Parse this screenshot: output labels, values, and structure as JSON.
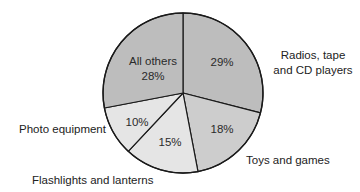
{
  "chart_data": {
    "type": "pie",
    "title": "",
    "start_angle_deg_from_top": 0,
    "direction": "clockwise",
    "center": [
      183,
      93
    ],
    "radius": 80,
    "slices": [
      {
        "name": "Radios, tape and CD players",
        "label_lines": [
          "Radios, tape",
          "and CD players"
        ],
        "value": 29,
        "pct_label": "29%",
        "color": "#bdbdbd",
        "pct_pos": [
          222,
          66
        ],
        "label_pos": [
          313,
          59
        ],
        "label_anchor": "middle"
      },
      {
        "name": "Toys and games",
        "label_lines": [
          "Toys and games"
        ],
        "value": 18,
        "pct_label": "18%",
        "color": "#cdcdcd",
        "pct_pos": [
          222,
          133
        ],
        "label_pos": [
          246,
          164
        ],
        "label_anchor": "start"
      },
      {
        "name": "Flashlights and lanterns",
        "label_lines": [
          "Flashlights and lanterns"
        ],
        "value": 15,
        "pct_label": "15%",
        "color": "#e5e5e5",
        "pct_pos": [
          170,
          146
        ],
        "label_pos": [
          32,
          184
        ],
        "label_anchor": "start"
      },
      {
        "name": "Photo equipment",
        "label_lines": [
          "Photo equipment"
        ],
        "value": 10,
        "pct_label": "10%",
        "color": "#e5e5e5",
        "pct_pos": [
          137,
          126
        ],
        "label_pos": [
          19,
          133
        ],
        "label_anchor": "start"
      },
      {
        "name": "All others",
        "label_lines": [],
        "inner_lines": [
          "All others",
          "28%"
        ],
        "value": 28,
        "pct_label": "28%",
        "color": "#bdbdbd",
        "pct_pos": [
          153,
          65
        ],
        "inner_name_pos": [
          153,
          65
        ],
        "inner_pct_pos": [
          153,
          80
        ]
      }
    ],
    "categories": [
      "Radios, tape and CD players",
      "Toys and games",
      "Flashlights and lanterns",
      "Photo equipment",
      "All others"
    ],
    "values": [
      29,
      18,
      15,
      10,
      28
    ],
    "legend": "none (labels placed outside slices)"
  }
}
